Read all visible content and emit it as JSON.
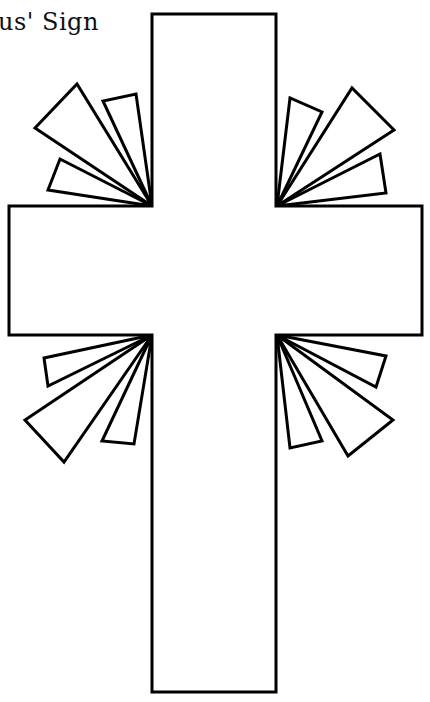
{
  "page": {
    "title": "us' Sign",
    "line_color": "#000000",
    "fill_color": "#ffffff"
  },
  "cross": {
    "vertical_beam": {
      "x": 152,
      "y": 14,
      "width": 124,
      "height": 678
    },
    "horizontal_beam": {
      "x": 9,
      "y": 206,
      "width": 413,
      "height": 129
    }
  },
  "rays": {
    "top_left": [
      "152,206 35,128 77,84",
      "152,206 103,101 136,94",
      "152,206 48,190 60,159"
    ],
    "top_right": [
      "277,206 290,98 322,112",
      "277,206 352,88 394,130",
      "277,206 380,154 386,193"
    ],
    "bottom_left": [
      "152,335 44,358 48,386",
      "152,335 25,420 64,462",
      "152,335 102,441 134,444"
    ],
    "bottom_right": [
      "277,335 386,356 376,387",
      "277,335 393,420 348,456",
      "277,335 290,448 322,441"
    ]
  }
}
